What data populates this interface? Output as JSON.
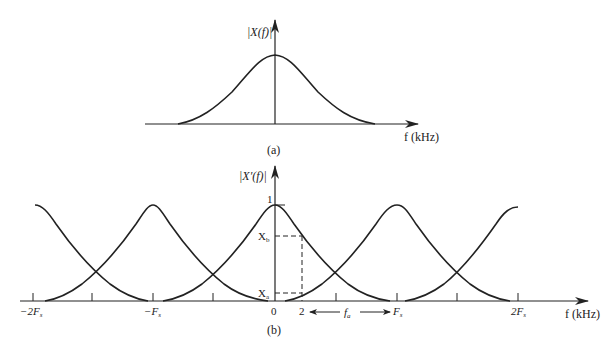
{
  "figure": {
    "panel_a": {
      "ylabel": "|X(f)|",
      "xlabel": "f (kHz)",
      "caption": "(a)"
    },
    "panel_b": {
      "ylabel": "|X′(f)|",
      "xlabel": "f (kHz)",
      "caption": "(b)",
      "peak_label": "1",
      "level_labels": {
        "xb": "X",
        "xb_sub": "b",
        "xa": "X",
        "xa_sub": "a"
      },
      "tick_labels": {
        "neg2fs": "−2F",
        "neg2fs_sub": "s",
        "negfs": "−F",
        "negfs_sub": "s",
        "zero": "0",
        "two": "2",
        "fs": "F",
        "fs_sub": "s",
        "twofs": "2F",
        "twofs_sub": "s"
      },
      "fa_label": "f",
      "fa_sub": "a"
    }
  },
  "colors": {
    "ink": "#222222",
    "background": "#ffffff"
  }
}
